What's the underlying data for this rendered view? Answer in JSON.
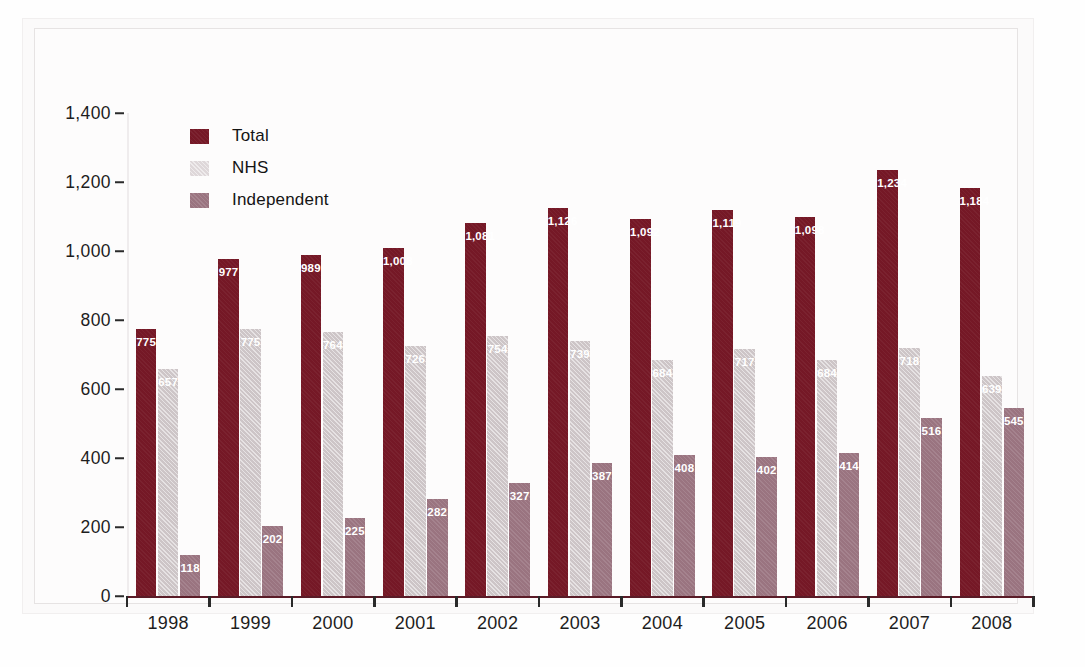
{
  "chart_data": {
    "type": "bar",
    "title": "",
    "subtitle": "",
    "xlabel": "",
    "ylabel": "",
    "categories": [
      "1998",
      "1999",
      "2000",
      "2001",
      "2002",
      "2003",
      "2004",
      "2005",
      "2006",
      "2007",
      "2008"
    ],
    "series": [
      {
        "name": "Total",
        "color": "#751826",
        "values": [
          775,
          977,
          989,
          1008,
          1081,
          1126,
          1092,
          1119,
          1098,
          1234,
          1184
        ],
        "labels": [
          "775",
          "977",
          "989",
          "1,008",
          "1,081",
          "1,126",
          "1,092",
          "1,119",
          "1,098",
          "1,234",
          "1,184"
        ]
      },
      {
        "name": "NHS",
        "color": "#cdc5c7",
        "values": [
          657,
          775,
          764,
          726,
          754,
          739,
          684,
          717,
          684,
          718,
          639
        ],
        "labels": [
          "657",
          "775",
          "764",
          "726",
          "754",
          "739",
          "684",
          "717",
          "684",
          "718",
          "639"
        ]
      },
      {
        "name": "Independent",
        "color": "#9a7480",
        "values": [
          118,
          202,
          225,
          282,
          327,
          387,
          408,
          402,
          414,
          516,
          545
        ],
        "labels": [
          "118",
          "202",
          "225",
          "282",
          "327",
          "387",
          "408",
          "402",
          "414",
          "516",
          "545"
        ]
      }
    ],
    "ylim": [
      0,
      1400
    ],
    "yticks": [
      0,
      200,
      400,
      600,
      800,
      1000,
      1200,
      1400
    ],
    "ytick_labels": [
      "0",
      "200",
      "400",
      "600",
      "800",
      "1,000",
      "1,200",
      "1,400"
    ],
    "grid": false,
    "legend_position": "top-left",
    "legend": [
      "Total",
      "NHS",
      "Independent"
    ]
  },
  "legend": {
    "items": [
      {
        "label": "Total",
        "key": "total"
      },
      {
        "label": "NHS",
        "key": "nhs"
      },
      {
        "label": "Independent",
        "key": "independent"
      }
    ]
  },
  "colors": {
    "total": "#751826",
    "nhs": "#cdc5c7",
    "independent": "#9a7480",
    "axis": "#5a1b27",
    "text": "#1d1d1d",
    "background": "#fdfcfc"
  }
}
